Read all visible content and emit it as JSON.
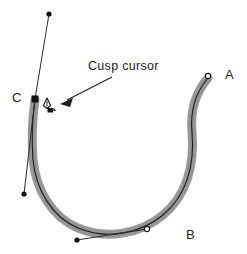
{
  "figure": {
    "background_color": "#ffffff",
    "stroke_color_outer": "#9a9a9a",
    "stroke_color_inner": "#1a1a1a",
    "handle_color": "#2b2b2b",
    "anchor_fill_hollow": "#ffffff",
    "anchor_fill_solid": "#111111"
  },
  "annotation": {
    "text": "Cusp cursor",
    "arrow_from": [
      112,
      77
    ],
    "arrow_to": [
      62,
      103
    ]
  },
  "labels": [
    {
      "id": "A",
      "text": "A",
      "x": 225,
      "y": 68
    },
    {
      "id": "B",
      "text": "B",
      "x": 186,
      "y": 228
    },
    {
      "id": "C",
      "text": "C",
      "x": 12,
      "y": 91
    }
  ],
  "path": {
    "description": "Open horseshoe / C-shaped bezier path drawn with a thick light-gray stroke and a thin black center line",
    "points": [
      {
        "id": "A",
        "type": "endpoint-anchor",
        "marker": "hollow-circle",
        "x": 208,
        "y": 76
      },
      {
        "id": "B",
        "type": "smooth-anchor",
        "marker": "hollow-circle",
        "x": 147,
        "y": 229
      },
      {
        "id": "C",
        "type": "cusp-anchor",
        "marker": "solid-square",
        "x": 35,
        "y": 99
      }
    ]
  },
  "handles": [
    {
      "id": "handle-c-up",
      "anchor": "C",
      "from": [
        35,
        99
      ],
      "to": [
        49,
        14
      ],
      "endpoint_marker": "solid-dot"
    },
    {
      "id": "handle-c-down",
      "anchor": "C",
      "from": [
        35,
        99
      ],
      "to": [
        24,
        194
      ],
      "endpoint_marker": "solid-dot"
    },
    {
      "id": "handle-b-left",
      "anchor": "B",
      "from": [
        147,
        229
      ],
      "to": [
        77,
        240
      ],
      "endpoint_marker": "solid-dot"
    }
  ],
  "cursor": {
    "name": "cusp-pen-cursor",
    "x": 47,
    "y": 104,
    "glyph": "pen-nib-with-caret"
  }
}
